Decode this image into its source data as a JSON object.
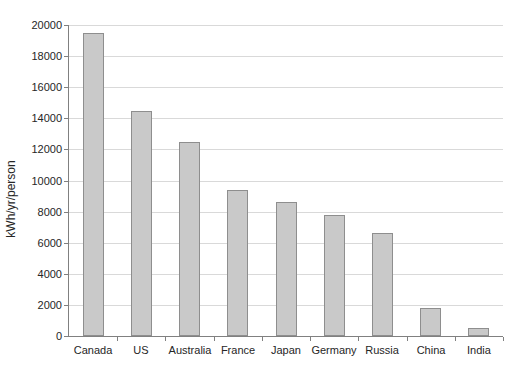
{
  "chart_data": {
    "type": "bar",
    "title": "",
    "categories": [
      "Canada",
      "US",
      "Australia",
      "France",
      "Japan",
      "Germany",
      "Russia",
      "China",
      "India"
    ],
    "values": [
      19500,
      14500,
      12500,
      9400,
      8600,
      7800,
      6600,
      1800,
      500
    ],
    "xlabel": "",
    "ylabel": "kWh/yr/person",
    "ylim": [
      0,
      20000
    ],
    "ytick_step": 2000,
    "ytick_labels": [
      "0",
      "2000",
      "4000",
      "6000",
      "8000",
      "10000",
      "12000",
      "14000",
      "16000",
      "18000",
      "20000"
    ],
    "grid": "horizontal",
    "legend_position": "none",
    "colors": {
      "bar_fill": "#c9c9c9",
      "bar_border": "#8e8e8e",
      "gridline": "#d9d9d9",
      "axis": "#808080",
      "text": "#262626",
      "background": "#ffffff"
    }
  }
}
